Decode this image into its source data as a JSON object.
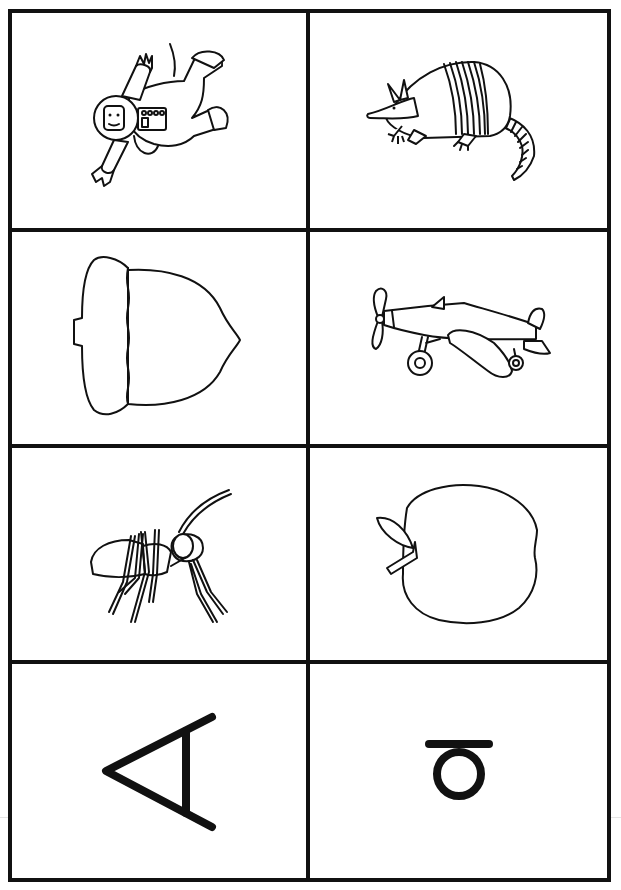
{
  "worksheet": {
    "layout": {
      "columns": 2,
      "rows": 4
    },
    "colors": {
      "ink": "#111111",
      "paper": "#ffffff",
      "scan_line": "#e4e4e4"
    },
    "cards": [
      {
        "id": "astronaut",
        "label": "astronaut",
        "type": "picture",
        "icon": "astronaut-icon"
      },
      {
        "id": "armadillo",
        "label": "armadillo",
        "type": "picture",
        "icon": "armadillo-icon"
      },
      {
        "id": "acorn",
        "label": "acorn",
        "type": "picture",
        "icon": "acorn-icon"
      },
      {
        "id": "airplane",
        "label": "airplane",
        "type": "picture",
        "icon": "airplane-icon"
      },
      {
        "id": "ant",
        "label": "ant",
        "type": "picture",
        "icon": "ant-icon"
      },
      {
        "id": "apple",
        "label": "apple",
        "type": "picture",
        "icon": "apple-icon"
      },
      {
        "id": "uppercase-letter",
        "label": "A",
        "type": "letter",
        "rotation_deg": -90,
        "icon": "uppercase-a-rotated-icon"
      },
      {
        "id": "lowercase-letter",
        "label": "a",
        "type": "letter",
        "rotation_deg": -90,
        "icon": "lowercase-a-rotated-icon"
      }
    ]
  }
}
